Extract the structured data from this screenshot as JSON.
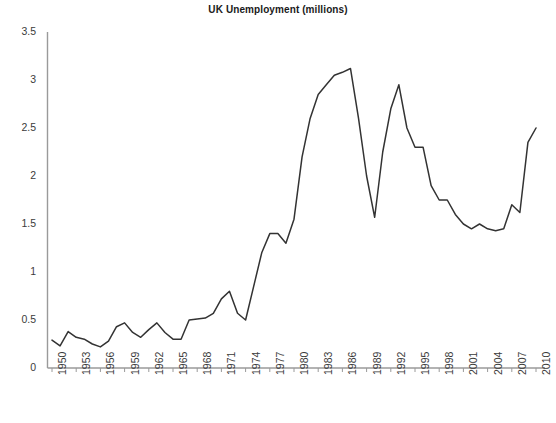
{
  "chart_data": {
    "type": "line",
    "title": "UK Unemployment (millions)",
    "xlabel": "",
    "ylabel": "",
    "ylim": [
      0,
      3.5
    ],
    "xlim": [
      1950,
      2010
    ],
    "ytick_labels": [
      "3.5",
      "3",
      "2.5",
      "2",
      "1.5",
      "1",
      "0.5",
      "0"
    ],
    "ytick_values": [
      3.5,
      3,
      2.5,
      2,
      1.5,
      1,
      0.5,
      0
    ],
    "xtick_labels": [
      "1950",
      "1953",
      "1956",
      "1959",
      "1962",
      "1965",
      "1968",
      "1971",
      "1974",
      "1977",
      "1980",
      "1983",
      "1986",
      "1989",
      "1992",
      "1995",
      "1998",
      "2001",
      "2004",
      "2007",
      "2010"
    ],
    "xtick_values": [
      1950,
      1953,
      1956,
      1959,
      1962,
      1965,
      1968,
      1971,
      1974,
      1977,
      1980,
      1983,
      1986,
      1989,
      1992,
      1995,
      1998,
      2001,
      2004,
      2007,
      2010
    ],
    "grid": false,
    "legend": false,
    "line_color": "#333333",
    "axis_color": "#9a9a9a",
    "series": [
      {
        "name": "UK Unemployment (millions)",
        "x": [
          1950,
          1951,
          1952,
          1953,
          1954,
          1955,
          1956,
          1957,
          1958,
          1959,
          1960,
          1961,
          1962,
          1963,
          1964,
          1965,
          1966,
          1967,
          1968,
          1969,
          1970,
          1971,
          1972,
          1973,
          1974,
          1975,
          1976,
          1977,
          1978,
          1979,
          1980,
          1981,
          1982,
          1983,
          1984,
          1985,
          1986,
          1987,
          1988,
          1989,
          1990,
          1991,
          1992,
          1993,
          1994,
          1995,
          1996,
          1997,
          1998,
          1999,
          2000,
          2001,
          2002,
          2003,
          2004,
          2005,
          2006,
          2007,
          2008,
          2009,
          2010
        ],
        "values": [
          0.29,
          0.23,
          0.38,
          0.32,
          0.3,
          0.25,
          0.22,
          0.28,
          0.43,
          0.47,
          0.37,
          0.32,
          0.4,
          0.47,
          0.37,
          0.3,
          0.3,
          0.5,
          0.51,
          0.52,
          0.57,
          0.72,
          0.8,
          0.57,
          0.5,
          0.85,
          1.2,
          1.4,
          1.4,
          1.3,
          1.55,
          2.2,
          2.6,
          2.85,
          2.95,
          3.05,
          3.08,
          3.12,
          2.6,
          2.0,
          1.57,
          2.25,
          2.7,
          2.95,
          2.5,
          2.3,
          2.3,
          1.9,
          1.75,
          1.75,
          1.6,
          1.5,
          1.45,
          1.5,
          1.45,
          1.43,
          1.45,
          1.7,
          1.62,
          2.35,
          2.5
        ]
      }
    ]
  },
  "footer": {
    "caption": ""
  }
}
